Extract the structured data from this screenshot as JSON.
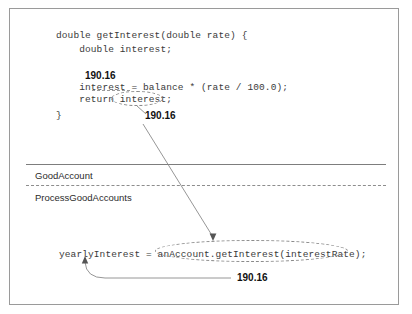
{
  "figure": {
    "border_color": "#9a9a9a",
    "code_color": "#3a3a3a",
    "value": "190.16"
  },
  "code_block_top": {
    "lines": [
      "double getInterest(double rate) {",
      "    double interest;",
      "",
      "    interest = balance * (rate / 100.0);",
      "    return interest;",
      "}"
    ],
    "line_1": "double getInterest(double rate) {",
    "line_2": "    double interest;",
    "line_3": "    interest = balance * (rate / 100.0);",
    "line_4": "    return interest;",
    "line_5": "}"
  },
  "code_block_bottom": {
    "line_1": "yearlyInterest = anAccount.getInterest(interestRate);"
  },
  "annotations": {
    "value_top": "190.16",
    "value_middle": "190.16",
    "value_bottom": "190.16"
  },
  "class_labels": {
    "upper": "GoodAccount",
    "lower": "ProcessGoodAccounts"
  }
}
